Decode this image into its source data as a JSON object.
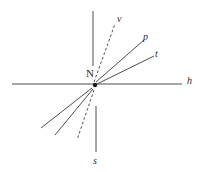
{
  "figure": {
    "type": "vector-ray-diagram",
    "background_color": "#ffffff",
    "stroke_color": "#3a3a3a",
    "label_color": "#2b2b2b",
    "center": {
      "label": "N",
      "x": 95,
      "y": 85,
      "dot_radius": 2.2
    },
    "axes": [
      {
        "name": "horizontal-axis",
        "label": "h",
        "style": "solid",
        "x1": 12,
        "y1": 84,
        "x2": 182,
        "y2": 84
      },
      {
        "name": "vertical-axis-up",
        "label": "",
        "style": "solid",
        "x1": 93,
        "y1": 11,
        "x2": 93,
        "y2": 66
      },
      {
        "name": "vertical-axis-down",
        "label": "s",
        "style": "solid",
        "x1": 96,
        "y1": 106,
        "x2": 96,
        "y2": 152
      }
    ],
    "rays": [
      {
        "name": "ray-v",
        "label": "v",
        "style": "dashed",
        "x1": 94,
        "y1": 82,
        "x2": 115,
        "y2": 24
      },
      {
        "name": "ray-p",
        "label": "p",
        "style": "solid",
        "x1": 96,
        "y1": 82,
        "x2": 144,
        "y2": 40
      },
      {
        "name": "ray-t",
        "label": "t",
        "style": "solid",
        "x1": 97,
        "y1": 84,
        "x2": 154,
        "y2": 56
      },
      {
        "name": "ray-lower-left-outer",
        "label": "",
        "style": "solid",
        "x1": 92,
        "y1": 88,
        "x2": 41,
        "y2": 128
      },
      {
        "name": "ray-lower-left-inner",
        "label": "",
        "style": "solid",
        "x1": 93,
        "y1": 89,
        "x2": 55,
        "y2": 135
      },
      {
        "name": "ray-s-dashed",
        "label": "",
        "style": "dashed",
        "x1": 94,
        "y1": 90,
        "x2": 77,
        "y2": 140
      }
    ],
    "labels": [
      {
        "name": "label-v",
        "text": "v",
        "x": 117,
        "y": 14,
        "style": "italic"
      },
      {
        "name": "label-p",
        "text": "p",
        "x": 143,
        "y": 32,
        "style": "italic"
      },
      {
        "name": "label-t",
        "text": "t",
        "x": 155,
        "y": 49,
        "style": "italic"
      },
      {
        "name": "label-h",
        "text": "h",
        "x": 187,
        "y": 76,
        "style": "italic"
      },
      {
        "name": "label-s",
        "text": "s",
        "x": 93,
        "y": 156,
        "style": "italic"
      },
      {
        "name": "label-N",
        "text": "N",
        "x": 86,
        "y": 68,
        "style": "upright"
      }
    ]
  }
}
